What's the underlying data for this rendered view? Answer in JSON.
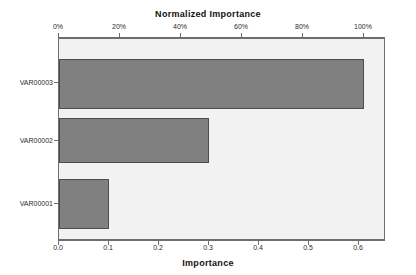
{
  "chart_data": {
    "type": "bar",
    "orientation": "horizontal",
    "title": "",
    "top_axis_title": "Normalized Importance",
    "bottom_axis_title": "Importance",
    "xlabel": "Importance",
    "ylabel": "",
    "categories": [
      "VAR00001",
      "VAR00002",
      "VAR00003"
    ],
    "values": [
      0.1,
      0.3,
      0.61
    ],
    "normalized_values_percent": [
      17,
      49,
      100
    ],
    "series": [
      {
        "name": "Importance",
        "values": [
          0.1,
          0.3,
          0.61
        ]
      }
    ],
    "bottom_axis": {
      "label": "Importance",
      "ticks": [
        0.0,
        0.1,
        0.2,
        0.3,
        0.4,
        0.5,
        0.6
      ],
      "tick_labels": [
        "0.0",
        "0.1",
        "0.2",
        "0.3",
        "0.4",
        "0.5",
        "0.6"
      ],
      "min": 0.0,
      "max": 0.654
    },
    "top_axis": {
      "label": "Normalized Importance",
      "ticks": [
        0,
        20,
        40,
        60,
        80,
        100
      ],
      "tick_labels": [
        "0%",
        "20%",
        "40%",
        "60%",
        "80%",
        "100%"
      ],
      "min": 0,
      "max": 107.2
    },
    "grid": false,
    "legend": null,
    "colors": {
      "bar_fill": "#808080",
      "bar_border": "#4d4d4d",
      "plot_background": "#f2f2f2",
      "plot_border": "#6e6e6e",
      "figure_background": "#ffffff",
      "text": "#1a1a1a"
    }
  },
  "bars": [
    {
      "category": "VAR00003",
      "value": 0.61,
      "normalized_percent": 100
    },
    {
      "category": "VAR00002",
      "value": 0.3,
      "normalized_percent": 49
    },
    {
      "category": "VAR00001",
      "value": 0.1,
      "normalized_percent": 17
    }
  ],
  "y_axis_labels": [
    "VAR00003",
    "VAR00002",
    "VAR00001"
  ],
  "top_tick_labels": [
    "0%",
    "20%",
    "40%",
    "60%",
    "80%",
    "100%"
  ],
  "bottom_tick_labels": [
    "0.0",
    "0.1",
    "0.2",
    "0.3",
    "0.4",
    "0.5",
    "0.6"
  ]
}
